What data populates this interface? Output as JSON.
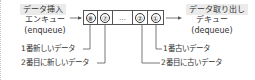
{
  "enqueue": {
    "tag": "データ挿入",
    "jp": "エンキュー",
    "en": "(enqueue)"
  },
  "dequeue": {
    "tag": "データ取り出し",
    "jp": "デキュー",
    "en": "(dequeue)"
  },
  "queue": {
    "cells": [
      "⑧",
      "⑦",
      "…",
      "②",
      "①"
    ]
  },
  "labels": {
    "newest": "1番新しいデータ",
    "second_newest": "2番目に新しいデータ",
    "oldest": "1番古いデータ",
    "second_oldest": "2番目に古いデータ"
  },
  "colors": {
    "tag_bg": "#ebebeb",
    "line": "#555555",
    "text": "#333333"
  }
}
